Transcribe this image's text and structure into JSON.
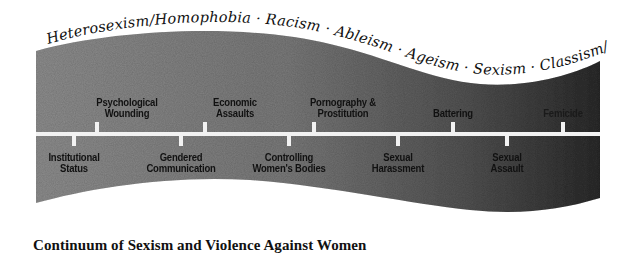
{
  "diagram": {
    "title": "Continuum of Sexism and Violence Against Women",
    "banner_isms": [
      "Heterosexism/Homophobia",
      "Racism",
      "Ableism",
      "Ageism",
      "Sexism",
      "Classism/Elitism"
    ],
    "banner_text": "Heterosexism/Homophobia  ·  Racism  ·  Ableism  ·  Ageism  ·  Sexism  ·  Classism/Elitism",
    "colors": {
      "band_light": "#8c8c8c",
      "band_dark": "#2e2e2e",
      "timeline": "#f2f2f2",
      "label_text": "#111111"
    },
    "above_line": [
      {
        "label": "Psychological\nWounding",
        "x": 127
      },
      {
        "label": "Economic\nAssaults",
        "x": 235
      },
      {
        "label": "Pornography &\nProstitution",
        "x": 343
      },
      {
        "label": "Battering",
        "x": 452
      },
      {
        "label": "Femicide",
        "x": 561
      }
    ],
    "below_line": [
      {
        "label": "Institutional\nStatus",
        "x": 74
      },
      {
        "label": "Gendered\nCommunication",
        "x": 181
      },
      {
        "label": "Controlling\nWomen's Bodies",
        "x": 289
      },
      {
        "label": "Sexual\nHarassment",
        "x": 398
      },
      {
        "label": "Sexual\nAssault",
        "x": 507
      }
    ]
  }
}
